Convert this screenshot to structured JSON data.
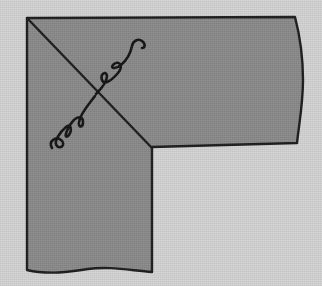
{
  "image": {
    "title": "Shaded L-shaped corner region with two wavy arrow-free squiggle lines crossing a diagonal",
    "width": 322,
    "height": 286,
    "description": "A grey textured L-shaped (reversed-L) polygon drawn with a dark hand-drawn outline on a light grey textured background. A straight diagonal line runs from the top-left corner to the inner corner of the L. Two squiggly wave lines cross the diagonal near its midpoint, one below-left and one above-right."
  },
  "colors": {
    "background": "#d4d4d4",
    "shape_fill": "#8a8a8a",
    "outline": "#1c1c1c",
    "squiggle": "#141414"
  },
  "geometry": {
    "stroke_width_outline": 2.4,
    "stroke_width_squiggle": 2.6,
    "shape_outline_path": "M 27,18 L 295,17 C 301,40 303,60 303,80 C 303,104 299,124 297,143 L 152,147 L 152,272 C 128,270 108,266 88,269 C 70,272 48,275 27,270 Z",
    "diagonal_line": {
      "x1": 27,
      "y1": 18,
      "x2": 152,
      "y2": 148
    },
    "squiggle_lower_left": "M 52,148 C 48,141 56,136 61,140 C 66,144 61,150 57,146 C 53,142 60,132 66,127 C 72,122 72,132 68,136 C 63,140 67,127 73,121 C 79,115 83,117 83,122 C 83,128 78,128 79,122 C 80,114 89,104 95,96",
    "squiggle_upper_right": "M 96,94 C 102,88 107,82 107,76 C 106,70 100,74 102,80 C 104,86 112,80 118,73 C 124,66 119,60 114,64 C 109,68 115,70 121,65 C 128,59 131,51 132,46 C 133,41 138,38 142,41 C 146,44 145,48 142,48",
    "corners": {
      "top_left": [
        27,
        18
      ],
      "top_right": [
        295,
        17
      ],
      "right_bulge": [
        303,
        80
      ],
      "mid_right": [
        297,
        143
      ],
      "inner_corner": [
        152,
        147
      ],
      "bottom_arm_right": [
        152,
        272
      ],
      "bottom_left": [
        27,
        270
      ]
    }
  },
  "elements": {
    "background_label": "background",
    "shape_label": "l-shaped-region",
    "diagonal_label": "diagonal-line",
    "squiggle_lower_label": "lower-left-squiggle",
    "squiggle_upper_label": "upper-right-squiggle"
  }
}
